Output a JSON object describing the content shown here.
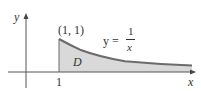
{
  "diagram": {
    "axis_x_label": "x",
    "axis_y_label": "y",
    "tick_label": "1",
    "point_label": "(1, 1)",
    "equation_lhs": "y =",
    "equation_num": "1",
    "equation_den": "x",
    "region_label": "D",
    "colors": {
      "region_fill": "#d8d8d8",
      "curve": "#6b6b6b",
      "axes": "#444444"
    }
  }
}
